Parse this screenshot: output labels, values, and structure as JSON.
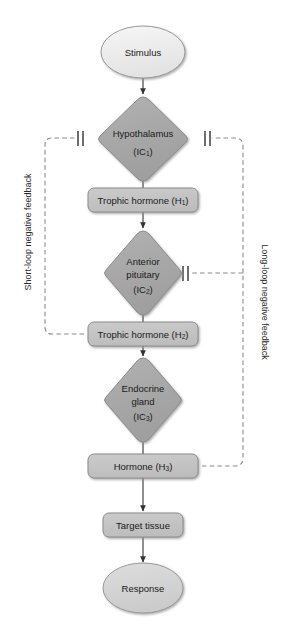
{
  "diagram": {
    "colors": {
      "ellipse_top_fill": "#ececec",
      "ellipse_bottom_fill": "#d5d5d5",
      "diamond_fill": "#a9a9a9",
      "box_fill": "#c4c4c4",
      "stroke": "#7d7d7d",
      "text": "#1a1a1a",
      "arrow": "#333333",
      "dashed": "#8a8a8a"
    },
    "nodes": [
      {
        "id": "stimulus",
        "shape": "ellipse",
        "label": "Stimulus",
        "sub": "",
        "cx": 143,
        "cy": 52,
        "rx": 42,
        "ry": 26
      },
      {
        "id": "hypothalamus",
        "shape": "diamond",
        "label": "Hypothalamus",
        "sub": "(IC",
        "subn": "1",
        "cx": 143,
        "cy": 139,
        "rx": 45,
        "ry": 42
      },
      {
        "id": "trophic-h1",
        "shape": "box",
        "label": "Trophic hormone (H",
        "subn": "1",
        "cx": 143,
        "cy": 200,
        "w": 110,
        "h": 24
      },
      {
        "id": "anterior-pituitary",
        "shape": "diamond",
        "label": "Anterior",
        "label2": "pituitary",
        "sub": "(IC",
        "subn": "2",
        "cx": 143,
        "cy": 273,
        "rx": 40,
        "ry": 42
      },
      {
        "id": "trophic-h2",
        "shape": "box",
        "label": "Trophic hormone (H",
        "subn": "2",
        "cx": 143,
        "cy": 334,
        "w": 110,
        "h": 24
      },
      {
        "id": "endocrine-gland",
        "shape": "diamond",
        "label": "Endocrine",
        "label2": "gland",
        "sub": "(IC",
        "subn": "3",
        "cx": 143,
        "cy": 400,
        "rx": 40,
        "ry": 42
      },
      {
        "id": "hormone-h3",
        "shape": "box",
        "label": "Hormone (H",
        "subn": "3",
        "cx": 143,
        "cy": 466,
        "w": 110,
        "h": 24
      },
      {
        "id": "target-tissue",
        "shape": "box",
        "label": "Target tissue",
        "sub": "",
        "cx": 143,
        "cy": 525,
        "w": 80,
        "h": 24
      },
      {
        "id": "response",
        "shape": "ellipse",
        "label": "Response",
        "sub": "",
        "cx": 143,
        "cy": 588,
        "rx": 40,
        "ry": 24
      }
    ],
    "labels": {
      "stimulus": "Stimulus",
      "hypothalamus": "Hypothalamus",
      "hypothalamus_sub_pre": "(IC",
      "hypothalamus_sub_n": "1",
      "hypothalamus_sub_post": ")",
      "trophic_h1_pre": "Trophic hormone (H",
      "trophic_h1_n": "1",
      "trophic_h1_post": ")",
      "anterior_line1": "Anterior",
      "anterior_line2": "pituitary",
      "anterior_sub_pre": "(IC",
      "anterior_sub_n": "2",
      "anterior_sub_post": ")",
      "trophic_h2_pre": "Trophic hormone (H",
      "trophic_h2_n": "2",
      "trophic_h2_post": ")",
      "endocrine_line1": "Endocrine",
      "endocrine_line2": "gland",
      "endocrine_sub_pre": "(IC",
      "endocrine_sub_n": "3",
      "endocrine_sub_post": ")",
      "hormone_h3_pre": "Hormone (H",
      "hormone_h3_n": "3",
      "hormone_h3_post": ")",
      "target_tissue": "Target tissue",
      "response": "Response",
      "short_loop": "Short-loop negative feedback",
      "long_loop": "Long-loop negative feedback"
    },
    "feedback": {
      "short_loop_label": "Short-loop negative feedback",
      "long_loop_label": "Long-loop negative feedback",
      "short_loop_source": "Trophic hormone (H2)",
      "short_loop_target": "Hypothalamus (IC1)",
      "long_loop_source": "Hormone (H3)",
      "long_loop_targets": [
        "Anterior pituitary (IC2)",
        "Hypothalamus (IC1)"
      ],
      "inhibition_symbol": "||"
    }
  }
}
